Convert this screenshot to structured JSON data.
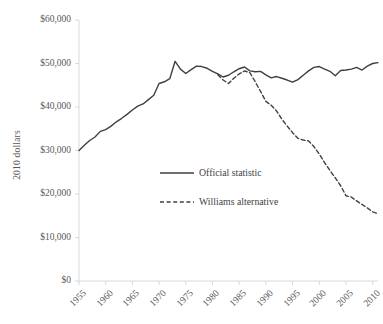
{
  "chart_data": {
    "type": "line",
    "title": "",
    "subtitle": "",
    "xlabel": "",
    "ylabel": "2010 dollars",
    "xlim": [
      1955,
      2011
    ],
    "ylim": [
      0,
      60000
    ],
    "grid": false,
    "legend_position": "center-left-inside",
    "y_ticks": [
      0,
      10000,
      20000,
      30000,
      40000,
      50000,
      60000
    ],
    "y_tick_labels": [
      "$0",
      "$10,000",
      "$20,000",
      "$30,000",
      "$40,000",
      "$50,000",
      "$60,000"
    ],
    "x_ticks": [
      1955,
      1960,
      1965,
      1970,
      1975,
      1980,
      1985,
      1990,
      1995,
      2000,
      2005,
      2010
    ],
    "x_tick_labels": [
      "1955",
      "1960",
      "1965",
      "1970",
      "1975",
      "1980",
      "1985",
      "1990",
      "1995",
      "2000",
      "2005",
      "2010"
    ],
    "series": [
      {
        "name": "Official statistic",
        "style": "solid",
        "color": "#404040",
        "x": [
          1955,
          1956,
          1957,
          1958,
          1959,
          1960,
          1961,
          1962,
          1963,
          1964,
          1965,
          1966,
          1967,
          1968,
          1969,
          1970,
          1971,
          1972,
          1973,
          1974,
          1975,
          1976,
          1977,
          1978,
          1979,
          1980,
          1981,
          1982,
          1983,
          1984,
          1985,
          1986,
          1987,
          1988,
          1989,
          1990,
          1991,
          1992,
          1993,
          1994,
          1995,
          1996,
          1997,
          1998,
          1999,
          2000,
          2001,
          2002,
          2003,
          2004,
          2005,
          2006,
          2007,
          2008,
          2009,
          2010,
          2011
        ],
        "values": [
          30000,
          31200,
          32300,
          33100,
          34400,
          34800,
          35600,
          36600,
          37400,
          38300,
          39300,
          40200,
          40700,
          41700,
          42700,
          45400,
          45800,
          46500,
          50500,
          48700,
          47700,
          48600,
          49400,
          49300,
          48900,
          48200,
          47600,
          46900,
          47300,
          48100,
          48800,
          49200,
          48300,
          48100,
          48200,
          47400,
          46700,
          47000,
          46600,
          46200,
          45700,
          46300,
          47300,
          48300,
          49100,
          49300,
          48700,
          48200,
          47200,
          48400,
          48500,
          48700,
          49100,
          48500,
          49400,
          50000,
          50200
        ]
      },
      {
        "name": "Williams alternative",
        "style": "dashed",
        "color": "#404040",
        "x": [
          1981,
          1982,
          1983,
          1984,
          1985,
          1986,
          1987,
          1988,
          1989,
          1990,
          1991,
          1992,
          1993,
          1994,
          1995,
          1996,
          1997,
          1998,
          1999,
          2000,
          2001,
          2002,
          2003,
          2004,
          2005,
          2006,
          2007,
          2008,
          2009,
          2010,
          2011
        ],
        "values": [
          47400,
          46200,
          45400,
          46600,
          47600,
          48300,
          47900,
          45800,
          43600,
          41300,
          40400,
          39100,
          37200,
          35600,
          34100,
          32800,
          32400,
          32200,
          30900,
          29200,
          27200,
          25400,
          23700,
          21900,
          19600,
          19300,
          18400,
          17600,
          16800,
          15900,
          15500
        ]
      }
    ],
    "legend": [
      {
        "label": "Official statistic",
        "style": "solid"
      },
      {
        "label": "Williams alternative",
        "style": "dashed"
      }
    ]
  },
  "colors": {
    "line": "#404040",
    "axis": "#d0d0d0",
    "text": "#595959"
  }
}
